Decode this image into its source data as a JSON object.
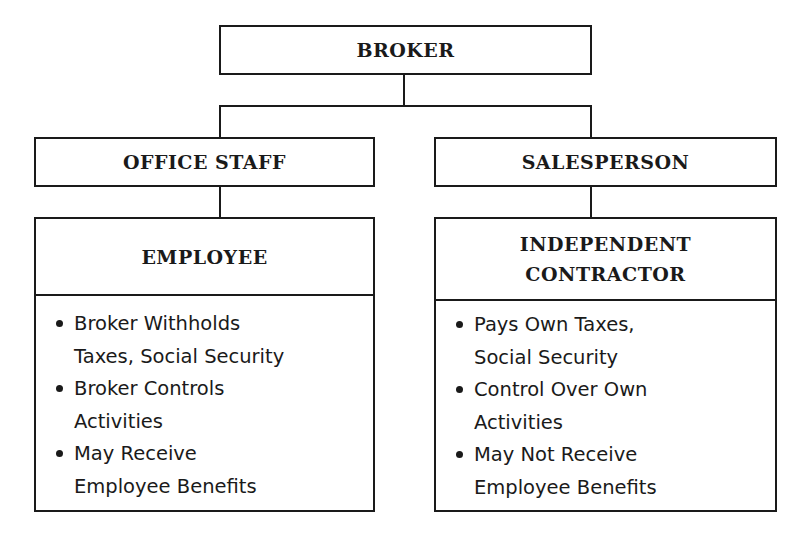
{
  "chart": {
    "root": {
      "label": "BROKER"
    },
    "branches": [
      {
        "role": "OFFICE STAFF",
        "classification": [
          "EMPLOYEE"
        ],
        "items": [
          [
            "Broker Withholds",
            "Taxes, Social Security"
          ],
          [
            "Broker Controls",
            "Activities"
          ],
          [
            "May Receive",
            "Employee Benefits"
          ]
        ]
      },
      {
        "role": "SALESPERSON",
        "classification": [
          "INDEPENDENT",
          "CONTRACTOR"
        ],
        "items": [
          [
            "Pays Own Taxes,",
            "Social Security"
          ],
          [
            "Control Over Own",
            "Activities"
          ],
          [
            "May Not Receive",
            "Employee Benefits"
          ]
        ]
      }
    ]
  },
  "colors": {
    "line": "#1a1a1a",
    "background": "#ffffff"
  }
}
